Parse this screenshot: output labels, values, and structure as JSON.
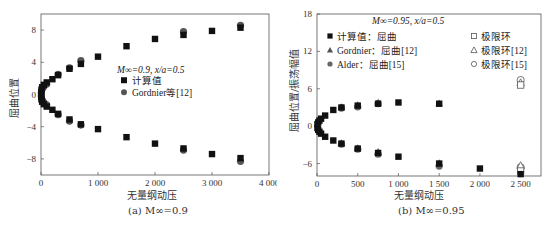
{
  "chart_data": [
    {
      "id": "a",
      "type": "scatter",
      "caption": "(a) M∞=0.9",
      "annotation": "M∞=0.9, x/a=0.5",
      "xlabel": "无量纲动压",
      "ylabel": "屈曲位置",
      "xlim": [
        0,
        4000
      ],
      "ylim": [
        -10,
        10
      ],
      "xticks": [
        0,
        1000,
        2000,
        3000,
        4000
      ],
      "xtick_labels": [
        "0",
        "1 000",
        "2 000",
        "3 000",
        "4 000"
      ],
      "yticks": [
        -8,
        -4,
        0,
        4,
        8
      ],
      "ytick_labels": [
        "−8",
        "−4",
        "0",
        "4",
        "8"
      ],
      "grid": false,
      "legend_position": "center",
      "series": [
        {
          "name": "计算值",
          "marker": "square-filled",
          "color": "#111111",
          "points": [
            [
              5,
              0.3
            ],
            [
              10,
              0.6
            ],
            [
              20,
              0.9
            ],
            [
              50,
              1.2
            ],
            [
              100,
              1.5
            ],
            [
              200,
              1.9
            ],
            [
              300,
              2.4
            ],
            [
              500,
              3.2
            ],
            [
              700,
              3.8
            ],
            [
              1000,
              4.7
            ],
            [
              1500,
              6.0
            ],
            [
              2000,
              6.9
            ],
            [
              2500,
              7.4
            ],
            [
              3000,
              7.9
            ],
            [
              3500,
              8.3
            ],
            [
              5,
              -0.3
            ],
            [
              10,
              -0.6
            ],
            [
              20,
              -0.9
            ],
            [
              50,
              -1.2
            ],
            [
              100,
              -1.5
            ],
            [
              200,
              -1.9
            ],
            [
              300,
              -2.4
            ],
            [
              500,
              -3.1
            ],
            [
              700,
              -3.7
            ],
            [
              1000,
              -4.3
            ],
            [
              1500,
              -5.3
            ],
            [
              2000,
              -6.1
            ],
            [
              2500,
              -6.7
            ],
            [
              3000,
              -7.4
            ],
            [
              3500,
              -7.9
            ]
          ]
        },
        {
          "name": "Gordnier等[12]",
          "marker": "circle-filled",
          "color": "#555555",
          "points": [
            [
              5,
              0.2
            ],
            [
              20,
              0.7
            ],
            [
              50,
              1.0
            ],
            [
              100,
              1.3
            ],
            [
              300,
              2.5
            ],
            [
              500,
              3.3
            ],
            [
              700,
              4.2
            ],
            [
              2500,
              7.8
            ],
            [
              3500,
              8.6
            ],
            [
              5,
              -0.2
            ],
            [
              20,
              -0.7
            ],
            [
              50,
              -1.0
            ],
            [
              100,
              -1.3
            ],
            [
              300,
              -2.5
            ],
            [
              500,
              -3.3
            ],
            [
              700,
              -3.8
            ],
            [
              2500,
              -6.9
            ],
            [
              3500,
              -8.3
            ]
          ]
        }
      ]
    },
    {
      "id": "b",
      "type": "scatter",
      "caption": "(b) M∞=0.95",
      "annotation": "M∞=0.95, x/a=0.5",
      "xlabel": "无量纲动压",
      "ylabel": "屈曲位置/振荡幅值",
      "xlim": [
        0,
        2750
      ],
      "ylim": [
        -8,
        18
      ],
      "xticks": [
        0,
        500,
        1000,
        1500,
        2000,
        2500
      ],
      "xtick_labels": [
        "0",
        "500",
        "1 000",
        "1 500",
        "2 000",
        "2 500"
      ],
      "yticks": [
        -6,
        0,
        6,
        12,
        18
      ],
      "ytick_labels": [
        "−6",
        "0",
        "6",
        "12",
        "18"
      ],
      "grid": false,
      "legend_position": "upper",
      "series": [
        {
          "name": "计算值：屈曲",
          "marker": "square-filled",
          "color": "#111111",
          "points": [
            [
              5,
              0.3
            ],
            [
              15,
              0.6
            ],
            [
              30,
              0.9
            ],
            [
              50,
              1.2
            ],
            [
              100,
              1.7
            ],
            [
              200,
              2.6
            ],
            [
              300,
              3.0
            ],
            [
              500,
              3.3
            ],
            [
              750,
              3.6
            ],
            [
              1000,
              3.8
            ],
            [
              1500,
              3.6
            ],
            [
              5,
              -0.3
            ],
            [
              15,
              -0.6
            ],
            [
              30,
              -0.9
            ],
            [
              50,
              -1.2
            ],
            [
              100,
              -1.7
            ],
            [
              200,
              -2.3
            ],
            [
              300,
              -2.8
            ],
            [
              500,
              -3.6
            ],
            [
              750,
              -4.3
            ],
            [
              1000,
              -4.9
            ],
            [
              1500,
              -6.0
            ],
            [
              2000,
              -6.8
            ],
            [
              2500,
              -7.7
            ]
          ]
        },
        {
          "name": "Gordnier：屈曲[12]",
          "marker": "triangle-filled",
          "color": "#555555",
          "points": [
            [
              300,
              3.1
            ],
            [
              500,
              3.4
            ],
            [
              750,
              3.8
            ],
            [
              1500,
              3.7
            ],
            [
              300,
              -2.7
            ],
            [
              500,
              -3.5
            ],
            [
              750,
              -4.1
            ],
            [
              1500,
              -5.9
            ]
          ]
        },
        {
          "name": "Alder：屈曲[15]",
          "marker": "circle-filled",
          "color": "#666666",
          "points": [
            [
              300,
              2.9
            ],
            [
              500,
              3.1
            ],
            [
              750,
              3.6
            ],
            [
              300,
              -2.9
            ],
            [
              500,
              -3.7
            ],
            [
              750,
              -4.5
            ],
            [
              1500,
              -6.4
            ]
          ]
        },
        {
          "name": "极限环",
          "marker": "square-open",
          "color": "#555555",
          "points": [
            [
              2500,
              6.6
            ],
            [
              2500,
              -7.2
            ]
          ]
        },
        {
          "name": "极限环[12]",
          "marker": "triangle-open",
          "color": "#555555",
          "points": [
            [
              2500,
              7.0
            ],
            [
              2500,
              -6.3
            ]
          ]
        },
        {
          "name": "极限环[15]",
          "marker": "circle-open",
          "color": "#555555",
          "points": [
            [
              2500,
              7.4
            ],
            [
              2500,
              -6.6
            ]
          ]
        }
      ]
    }
  ],
  "captions": {
    "a": "(a) M∞=0.9",
    "b": "(b) M∞=0.95"
  },
  "labels": {
    "a_x": "无量纲动压",
    "a_y": "屈曲位置",
    "b_x": "无量纲动压",
    "b_y": "屈曲位置/振荡幅值"
  }
}
